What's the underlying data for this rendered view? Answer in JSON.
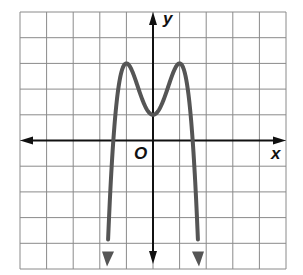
{
  "chart_data": {
    "type": "line",
    "title": "",
    "xlabel": "x",
    "ylabel": "y",
    "origin_label": "O",
    "xlim": [
      -5,
      5
    ],
    "ylim": [
      -5,
      5
    ],
    "grid": true,
    "grid_step": 1,
    "tick_labels": false,
    "series": [
      {
        "name": "f(x) = -2x^4 + 4x^2 + 1",
        "color": "#555555",
        "end_behavior": "both ends point downward (arrows)",
        "key_points": [
          {
            "label": "relative maximum",
            "x": -1,
            "y": 3
          },
          {
            "label": "relative minimum / y-intercept",
            "x": 0,
            "y": 1
          },
          {
            "label": "relative maximum",
            "x": 1,
            "y": 3
          },
          {
            "label": "x-intercept",
            "x": -1.5,
            "y": 0
          },
          {
            "label": "x-intercept",
            "x": 1.5,
            "y": 0
          }
        ],
        "x": [
          -1.85,
          -1.75,
          -1.5,
          -1.25,
          -1,
          -0.75,
          -0.5,
          -0.25,
          0,
          0.25,
          0.5,
          0.75,
          1,
          1.25,
          1.5,
          1.75,
          1.85
        ],
        "y": [
          -9.0,
          -6.5,
          -0.1,
          2.4,
          3.0,
          2.6,
          1.9,
          1.2,
          1.0,
          1.2,
          1.9,
          2.6,
          3.0,
          2.4,
          -0.1,
          -6.5,
          -9.0
        ]
      }
    ]
  },
  "colors": {
    "grid": "#8a8a8a",
    "axes": "#111111",
    "curve": "#555555"
  }
}
